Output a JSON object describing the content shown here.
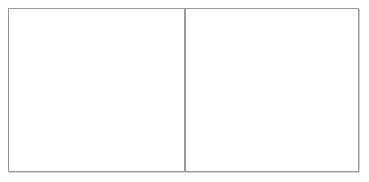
{
  "figure": {
    "title": "",
    "caption": "",
    "type": "particle-diagram",
    "background_color": "#ffffff",
    "border_color": "#9a9a9a",
    "panel_count": 2
  },
  "legend": {
    "dark_particle_label": "dark sphere",
    "light_particle_label": "light sphere",
    "dark_color": "#5a5a5a",
    "light_color": "#d8d8d8"
  },
  "panels": [
    {
      "name": "left-panel",
      "label": "",
      "x": 8,
      "y": 8,
      "width": 177,
      "height": 164,
      "particle_counts": {
        "dark": 8,
        "light": 0,
        "total": 8
      },
      "particles": [
        {
          "type": "dark",
          "cx": 61,
          "cy": 62,
          "r": 7.5
        },
        {
          "type": "dark",
          "cx": 78,
          "cy": 45,
          "r": 7.5
        },
        {
          "type": "dark",
          "cx": 70,
          "cy": 85,
          "r": 7.5
        },
        {
          "type": "dark",
          "cx": 101,
          "cy": 41,
          "r": 8.5
        },
        {
          "type": "dark",
          "cx": 96,
          "cy": 71,
          "r": 8.0
        },
        {
          "type": "dark",
          "cx": 120,
          "cy": 72,
          "r": 7.5
        },
        {
          "type": "dark",
          "cx": 93,
          "cy": 106,
          "r": 7.0
        },
        {
          "type": "dark",
          "cx": 123,
          "cy": 102,
          "r": 7.5
        }
      ]
    },
    {
      "name": "right-panel",
      "label": "",
      "x": 185,
      "y": 8,
      "width": 174,
      "height": 164,
      "particle_counts": {
        "dark": 14,
        "light": 19,
        "total": 33
      },
      "particles": [
        {
          "type": "dark",
          "cx": 212,
          "cy": 31,
          "r": 8.0
        },
        {
          "type": "light",
          "cx": 257,
          "cy": 26,
          "r": 8.0
        },
        {
          "type": "dark",
          "cx": 296,
          "cy": 30,
          "r": 8.0
        },
        {
          "type": "light",
          "cx": 228,
          "cy": 46,
          "r": 8.0
        },
        {
          "type": "dark",
          "cx": 250,
          "cy": 51,
          "r": 8.5
        },
        {
          "type": "light",
          "cx": 273,
          "cy": 48,
          "r": 8.0
        },
        {
          "type": "light",
          "cx": 300,
          "cy": 51,
          "r": 8.0
        },
        {
          "type": "dark",
          "cx": 208,
          "cy": 65,
          "r": 8.5
        },
        {
          "type": "light",
          "cx": 231,
          "cy": 65,
          "r": 8.0
        },
        {
          "type": "light",
          "cx": 259,
          "cy": 68,
          "r": 8.5
        },
        {
          "type": "light",
          "cx": 286,
          "cy": 68,
          "r": 8.0
        },
        {
          "type": "dark",
          "cx": 311,
          "cy": 64,
          "r": 8.5
        },
        {
          "type": "light",
          "cx": 337,
          "cy": 73,
          "r": 8.5
        },
        {
          "type": "light",
          "cx": 224,
          "cy": 82,
          "r": 8.0
        },
        {
          "type": "dark",
          "cx": 248,
          "cy": 83,
          "r": 8.5
        },
        {
          "type": "light",
          "cx": 267,
          "cy": 87,
          "r": 8.0
        },
        {
          "type": "dark",
          "cx": 303,
          "cy": 82,
          "r": 8.5
        },
        {
          "type": "light",
          "cx": 206,
          "cy": 97,
          "r": 8.0
        },
        {
          "type": "dark",
          "cx": 234,
          "cy": 96,
          "r": 8.5
        },
        {
          "type": "light",
          "cx": 283,
          "cy": 97,
          "r": 8.0
        },
        {
          "type": "dark",
          "cx": 330,
          "cy": 94,
          "r": 8.5
        },
        {
          "type": "light",
          "cx": 219,
          "cy": 111,
          "r": 8.0
        },
        {
          "type": "light",
          "cx": 255,
          "cy": 108,
          "r": 8.0
        },
        {
          "type": "light",
          "cx": 312,
          "cy": 107,
          "r": 8.0
        },
        {
          "type": "light",
          "cx": 240,
          "cy": 124,
          "r": 8.0
        },
        {
          "type": "light",
          "cx": 275,
          "cy": 123,
          "r": 8.0
        },
        {
          "type": "dark",
          "cx": 299,
          "cy": 121,
          "r": 8.0
        },
        {
          "type": "dark",
          "cx": 205,
          "cy": 133,
          "r": 8.0
        },
        {
          "type": "dark",
          "cx": 264,
          "cy": 136,
          "r": 8.5
        },
        {
          "type": "light",
          "cx": 228,
          "cy": 145,
          "r": 8.0
        },
        {
          "type": "light",
          "cx": 299,
          "cy": 140,
          "r": 8.0
        },
        {
          "type": "light",
          "cx": 330,
          "cy": 137,
          "r": 8.0
        },
        {
          "type": "light",
          "cx": 254,
          "cy": 153,
          "r": 8.0
        }
      ]
    }
  ]
}
